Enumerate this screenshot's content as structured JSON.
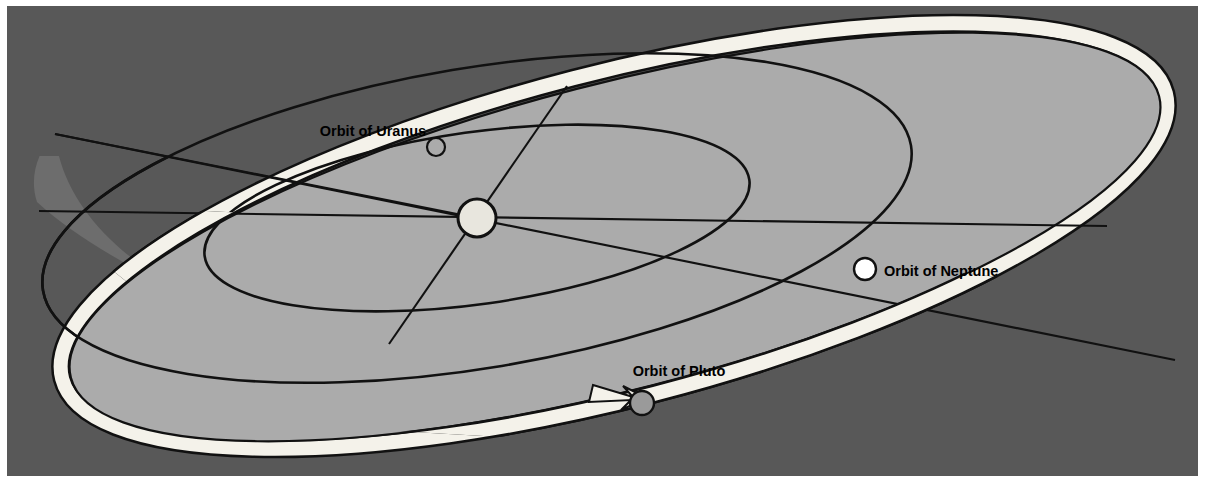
{
  "figure": {
    "kind": "astronomy-orbit-diagram",
    "colors": {
      "background": "#585858",
      "ecliptic_plane": "#ababab",
      "below_plane_shadow": "#6d6d6d",
      "orbit_line": "#111111",
      "pluto_band": "#f4f2ea",
      "sun_fill": "#e8e6de",
      "neptune_fill": "#ffffff",
      "pluto_fill": "#9a9a9a",
      "page_border": "#ffffff",
      "label_text": "#000000"
    },
    "labels": [
      {
        "id": "uranus",
        "text": "Orbit of Uranus",
        "text_x": 366,
        "text_y": 130,
        "anchor": "middle",
        "marker": {
          "cx": 429,
          "cy": 141,
          "r": 9,
          "fill": "#ababab",
          "stroke": "#111111"
        }
      },
      {
        "id": "neptune",
        "text": "Orbit of Neptune",
        "text_x": 877,
        "text_y": 270,
        "anchor": "start",
        "marker": {
          "cx": 858,
          "cy": 263,
          "r": 11,
          "fill": "#ffffff",
          "stroke": "#111111"
        }
      },
      {
        "id": "pluto",
        "text": "Orbit of Pluto",
        "text_x": 672,
        "text_y": 370,
        "anchor": "middle",
        "marker": {
          "cx": 635,
          "cy": 397,
          "r": 12,
          "fill": "#9a9a9a",
          "stroke": "#111111"
        }
      }
    ],
    "sun": {
      "cx": 470,
      "cy": 212,
      "rx": 19,
      "ry": 19
    },
    "bodies": [
      {
        "name": "Sun",
        "x": 470,
        "y": 212
      },
      {
        "name": "Uranus",
        "x": 429,
        "y": 141
      },
      {
        "name": "Neptune",
        "x": 858,
        "y": 263
      },
      {
        "name": "Pluto",
        "x": 635,
        "y": 397
      }
    ],
    "orbit_count": 3,
    "orbit_names": [
      "Orbit of Uranus",
      "Orbit of Neptune",
      "Orbit of Pluto"
    ],
    "caption": ""
  }
}
